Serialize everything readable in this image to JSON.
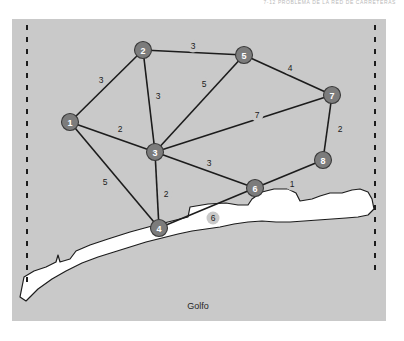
{
  "header": {
    "caption": "7-12   PROBLEMA DE LA RED DE CARRETERAS"
  },
  "map": {
    "background_color": "#c9c9c9",
    "gulf_label": "Golfo",
    "node_fill": "#7c7c7c",
    "node_text_color": "#ffffff",
    "edge_color": "#1c1c1c",
    "boundary_left_label": "western-border-dashed",
    "boundary_right_label": "eastern-border-dashed"
  },
  "graph_data": {
    "type": "network-graph",
    "title": "Road network problem",
    "directed": false,
    "nodes": [
      {
        "id": "1",
        "label": "1",
        "x": 70,
        "y": 122
      },
      {
        "id": "2",
        "label": "2",
        "x": 143,
        "y": 50
      },
      {
        "id": "3",
        "label": "3",
        "x": 155,
        "y": 152
      },
      {
        "id": "4",
        "label": "4",
        "x": 159,
        "y": 228
      },
      {
        "id": "5",
        "label": "5",
        "x": 244,
        "y": 55
      },
      {
        "id": "6",
        "label": "6",
        "x": 255,
        "y": 188
      },
      {
        "id": "7",
        "label": "7",
        "x": 332,
        "y": 95
      },
      {
        "id": "8",
        "label": "8",
        "x": 323,
        "y": 160
      }
    ],
    "edges": [
      {
        "from": "1",
        "to": "2",
        "weight": "3",
        "lx": 101,
        "ly": 80
      },
      {
        "from": "1",
        "to": "3",
        "weight": "2",
        "lx": 120,
        "ly": 129
      },
      {
        "from": "1",
        "to": "4",
        "weight": "5",
        "lx": 105,
        "ly": 182
      },
      {
        "from": "2",
        "to": "5",
        "weight": "3",
        "lx": 193,
        "ly": 46
      },
      {
        "from": "2",
        "to": "3",
        "weight": "3",
        "lx": 158,
        "ly": 96
      },
      {
        "from": "3",
        "to": "5",
        "weight": "5",
        "lx": 204,
        "ly": 84
      },
      {
        "from": "3",
        "to": "4",
        "weight": "2",
        "lx": 166,
        "ly": 194
      },
      {
        "from": "3",
        "to": "6",
        "weight": "3",
        "lx": 209,
        "ly": 163
      },
      {
        "from": "3",
        "to": "7",
        "weight": "7",
        "lx": 257,
        "ly": 115
      },
      {
        "from": "4",
        "to": "6",
        "weight": "6",
        "lx": 213,
        "ly": 218
      },
      {
        "from": "5",
        "to": "7",
        "weight": "4",
        "lx": 290,
        "ly": 68
      },
      {
        "from": "6",
        "to": "8",
        "weight": "1",
        "lx": 292,
        "ly": 184
      },
      {
        "from": "7",
        "to": "8",
        "weight": "2",
        "lx": 340,
        "ly": 129
      }
    ],
    "node_count": 8,
    "edge_count": 13
  }
}
